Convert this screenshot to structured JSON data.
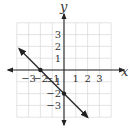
{
  "chart_data": {
    "type": "line",
    "title": "",
    "xlabel": "x",
    "ylabel": "y",
    "xlim": [
      -4,
      4
    ],
    "ylim": [
      -4,
      4
    ],
    "grid": true,
    "x_ticks": [
      -3,
      -2,
      -1,
      1,
      2,
      3
    ],
    "y_ticks": [
      3,
      2,
      1,
      -1,
      -2,
      -3
    ],
    "x_tick_labels": [
      "−3",
      "−2",
      "−1",
      "1",
      "2",
      "3"
    ],
    "y_tick_labels": [
      "3",
      "2",
      "1",
      "−1",
      "−2",
      "−3"
    ],
    "series": [
      {
        "name": "y = -x - 2",
        "equation": "y = -x - 2",
        "slope": -1,
        "intercept": -2,
        "x": [
          -3.8,
          2.0
        ],
        "y": [
          1.8,
          -4.0
        ],
        "arrows_both_ends": true
      }
    ],
    "points": [
      {
        "x": -2,
        "y": 0
      },
      {
        "x": 0,
        "y": -2
      }
    ]
  }
}
